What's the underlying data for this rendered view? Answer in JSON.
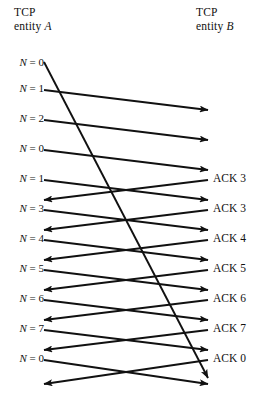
{
  "header": {
    "left": {
      "line1": "TCP",
      "line2": "entity A",
      "entity": "A"
    },
    "right": {
      "line1": "TCP",
      "line2": "entity B",
      "entity": "B"
    }
  },
  "colors": {
    "line": "#111111",
    "text": "#111111",
    "background": "#ffffff"
  },
  "sequence_labels": [
    {
      "text": "N = 0",
      "y": 62
    },
    {
      "text": "N = 1",
      "y": 88
    },
    {
      "text": "N = 2",
      "y": 118
    },
    {
      "text": "N = 0",
      "y": 148
    },
    {
      "text": "N = 1",
      "y": 178
    },
    {
      "text": "N = 3",
      "y": 208
    },
    {
      "text": "N = 4",
      "y": 238
    },
    {
      "text": "N = 5",
      "y": 268
    },
    {
      "text": "N = 6",
      "y": 298
    },
    {
      "text": "N = 7",
      "y": 328
    },
    {
      "text": "N = 0",
      "y": 358
    }
  ],
  "ack_labels": [
    {
      "text": "ACK 3",
      "y": 178
    },
    {
      "text": "ACK 3",
      "y": 208
    },
    {
      "text": "ACK 4",
      "y": 238
    },
    {
      "text": "ACK 5",
      "y": 268
    },
    {
      "text": "ACK 6",
      "y": 298
    },
    {
      "text": "ACK 7",
      "y": 328
    },
    {
      "text": "ACK 0",
      "y": 358
    }
  ],
  "chart_data": {
    "type": "diagram",
    "left_endpoint": "TCP entity A",
    "right_endpoint": "TCP entity B",
    "left_x": 44,
    "right_x": 208,
    "data_segments": [
      {
        "label": "N = 0",
        "from_y": 62,
        "to_y": 378,
        "direction": "A-to-B",
        "arrow": true,
        "kind": "delayed"
      },
      {
        "label": "N = 1",
        "from_y": 90,
        "to_y": 110,
        "direction": "A-to-B",
        "arrow": true,
        "kind": "data"
      },
      {
        "label": "N = 2",
        "from_y": 120,
        "to_y": 140,
        "direction": "A-to-B",
        "arrow": true,
        "kind": "data"
      },
      {
        "label": "N = 0",
        "from_y": 150,
        "to_y": 170,
        "direction": "A-to-B",
        "arrow": true,
        "kind": "data"
      },
      {
        "label": "N = 1",
        "from_y": 180,
        "to_y": 200,
        "direction": "A-to-B",
        "arrow": true,
        "kind": "data"
      },
      {
        "label": "N = 3",
        "from_y": 210,
        "to_y": 230,
        "direction": "A-to-B",
        "arrow": true,
        "kind": "data"
      },
      {
        "label": "N = 4",
        "from_y": 240,
        "to_y": 260,
        "direction": "A-to-B",
        "arrow": true,
        "kind": "data"
      },
      {
        "label": "N = 5",
        "from_y": 270,
        "to_y": 290,
        "direction": "A-to-B",
        "arrow": true,
        "kind": "data"
      },
      {
        "label": "N = 6",
        "from_y": 300,
        "to_y": 320,
        "direction": "A-to-B",
        "arrow": true,
        "kind": "data"
      },
      {
        "label": "N = 7",
        "from_y": 330,
        "to_y": 350,
        "direction": "A-to-B",
        "arrow": true,
        "kind": "data"
      },
      {
        "label": "N = 0",
        "from_y": 360,
        "to_y": 384,
        "direction": "A-to-B",
        "arrow": true,
        "kind": "data"
      }
    ],
    "ack_segments": [
      {
        "label": "ACK 3",
        "from_y": 180,
        "to_y": 200,
        "direction": "B-to-A",
        "arrow": true
      },
      {
        "label": "ACK 3",
        "from_y": 210,
        "to_y": 230,
        "direction": "B-to-A",
        "arrow": true
      },
      {
        "label": "ACK 4",
        "from_y": 240,
        "to_y": 260,
        "direction": "B-to-A",
        "arrow": true
      },
      {
        "label": "ACK 5",
        "from_y": 270,
        "to_y": 290,
        "direction": "B-to-A",
        "arrow": true
      },
      {
        "label": "ACK 6",
        "from_y": 300,
        "to_y": 320,
        "direction": "B-to-A",
        "arrow": true
      },
      {
        "label": "ACK 7",
        "from_y": 330,
        "to_y": 350,
        "direction": "B-to-A",
        "arrow": true
      },
      {
        "label": "ACK 0",
        "from_y": 360,
        "to_y": 384,
        "direction": "B-to-A",
        "arrow": true
      }
    ]
  }
}
